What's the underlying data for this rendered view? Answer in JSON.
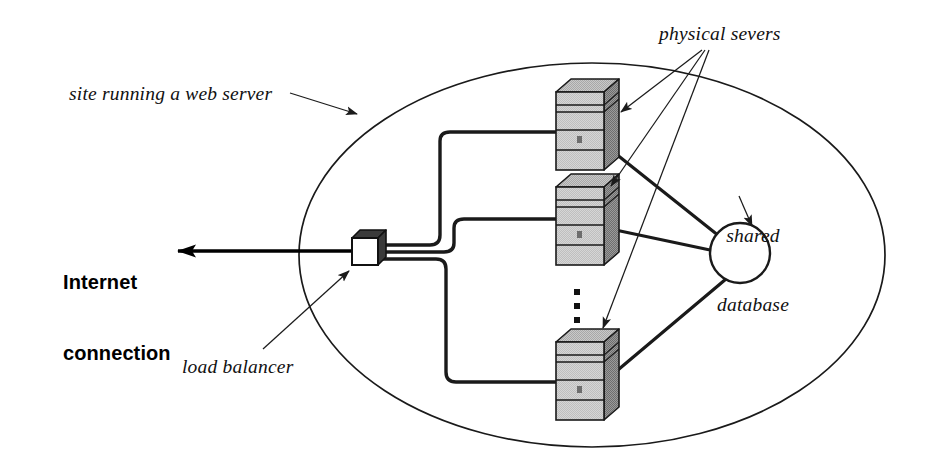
{
  "diagram": {
    "type": "network-architecture-diagram",
    "background_color": "#ffffff",
    "stroke_color": "#111111",
    "labels": {
      "site_boundary": "site running a web server",
      "physical_servers": "physical severs",
      "shared_database_line1": "shared",
      "shared_database_line2": "database",
      "internet_line1": "Internet",
      "internet_line2": "connection",
      "load_balancer": "load balancer"
    },
    "nodes": {
      "site_ellipse": {
        "name": "site-boundary-ellipse",
        "cx": 592,
        "cy": 255,
        "rx": 293,
        "ry": 192
      },
      "load_balancer": {
        "name": "load-balancer-box",
        "x": 352,
        "y": 238,
        "w": 26,
        "h": 27
      },
      "database": {
        "name": "shared-database-circle",
        "cx": 740,
        "cy": 253,
        "r": 30
      },
      "servers": [
        {
          "name": "physical-server-top",
          "x": 556,
          "y": 92,
          "w": 48,
          "h": 78
        },
        {
          "name": "physical-server-middle",
          "x": 556,
          "y": 187,
          "w": 48,
          "h": 78
        },
        {
          "name": "physical-server-bottom",
          "x": 556,
          "y": 342,
          "w": 48,
          "h": 78
        }
      ],
      "ellipsis_dots": {
        "name": "more-servers-ellipsis",
        "count": 3,
        "x": 577,
        "y_start": 292,
        "spacing": 14
      }
    },
    "connections": {
      "internet_arrow": {
        "name": "internet-connection-arrow",
        "from_x": 352,
        "from_y": 251,
        "to_x": 170,
        "to_y": 251
      },
      "lb_to_servers": "orthogonal-routed-thick-lines",
      "servers_to_database": "straight-thick-lines"
    },
    "annotation_arrows": [
      {
        "name": "site-label-arrow",
        "from_x": 288,
        "from_y": 93,
        "to_x": 357,
        "to_y": 114
      },
      {
        "name": "physical-arrow-top",
        "from_x": 702,
        "from_y": 48,
        "to_x": 619,
        "to_y": 111
      },
      {
        "name": "physical-arrow-middle",
        "from_x": 704,
        "from_y": 48,
        "to_x": 609,
        "to_y": 185
      },
      {
        "name": "physical-arrow-bottom",
        "from_x": 707,
        "from_y": 48,
        "to_x": 601,
        "to_y": 327
      },
      {
        "name": "database-label-arrow",
        "from_x": 742,
        "from_y": 195,
        "to_x": 753,
        "to_y": 224
      },
      {
        "name": "load-balancer-arrow",
        "from_x": 265,
        "from_y": 348,
        "to_x": 348,
        "to_y": 270
      }
    ]
  }
}
